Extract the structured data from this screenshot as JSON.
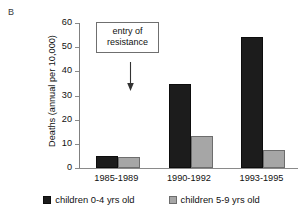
{
  "panel_label": "B",
  "chart_data": {
    "type": "bar",
    "title": "",
    "xlabel": "",
    "ylabel": "Deaths (annual per 10,000)",
    "ylim": [
      0,
      60
    ],
    "yticks": [
      0,
      10,
      20,
      30,
      40,
      50,
      60
    ],
    "grid": false,
    "legend_position": "bottom",
    "categories": [
      "1985-1989",
      "1990-1992",
      "1993-1995"
    ],
    "series": [
      {
        "name": "children 0-4 yrs old",
        "color": "#1c1c1c",
        "values": [
          5.0,
          34.8,
          54.3
        ]
      },
      {
        "name": "children 5-9 yrs old",
        "color": "#a6a6a6",
        "values": [
          4.5,
          13.4,
          7.6
        ]
      }
    ],
    "annotations": [
      {
        "text_line_1": "entry of",
        "text_line_2": "resistance",
        "marker": "down-arrow"
      }
    ]
  }
}
